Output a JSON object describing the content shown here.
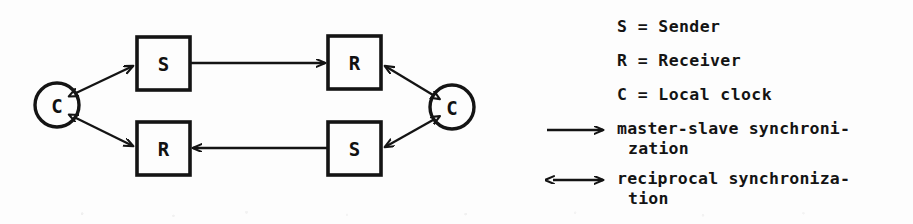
{
  "figure": {
    "kind": "synchronization-topology-diagram",
    "ink_color": "#141414",
    "paper_color": "#fdfdfd"
  },
  "diagram": {
    "nodes": [
      {
        "id": "clock-left",
        "shape": "circle",
        "label": "C",
        "cx": 57,
        "cy": 105,
        "r": 22
      },
      {
        "id": "sender-left",
        "shape": "box",
        "label": "S",
        "x": 137,
        "y": 37,
        "w": 53,
        "h": 53
      },
      {
        "id": "receiver-left",
        "shape": "box",
        "label": "R",
        "x": 137,
        "y": 122,
        "w": 53,
        "h": 53
      },
      {
        "id": "receiver-right",
        "shape": "box",
        "label": "R",
        "x": 328,
        "y": 36,
        "w": 53,
        "h": 53
      },
      {
        "id": "sender-right",
        "shape": "box",
        "label": "S",
        "x": 328,
        "y": 122,
        "w": 53,
        "h": 53
      },
      {
        "id": "clock-right",
        "shape": "circle",
        "label": "C",
        "cx": 452,
        "cy": 107,
        "r": 22
      }
    ],
    "edges": [
      {
        "id": "edge-sender-left-to-receiver-right",
        "from": "sender-left",
        "to": "receiver-right",
        "arrow": "single",
        "kind": "master-slave"
      },
      {
        "id": "edge-sender-right-to-receiver-left",
        "from": "sender-right",
        "to": "receiver-left",
        "arrow": "single",
        "kind": "master-slave"
      },
      {
        "id": "edge-clock-left-sender-left",
        "from": "clock-left",
        "to": "sender-left",
        "arrow": "double",
        "kind": "reciprocal"
      },
      {
        "id": "edge-clock-left-receiver-left",
        "from": "clock-left",
        "to": "receiver-left",
        "arrow": "double",
        "kind": "reciprocal"
      },
      {
        "id": "edge-clock-right-receiver-right",
        "from": "clock-right",
        "to": "receiver-right",
        "arrow": "double",
        "kind": "reciprocal"
      },
      {
        "id": "edge-clock-right-sender-right",
        "from": "clock-right",
        "to": "sender-right",
        "arrow": "double",
        "kind": "reciprocal"
      }
    ]
  },
  "legend": {
    "definitions": [
      "S = Sender",
      "R = Receiver",
      "C = Local clock"
    ],
    "entries": [
      {
        "symbol": "right-arrow",
        "line1": "master-slave synchroni-",
        "line2": "zation"
      },
      {
        "symbol": "bidirectional-arrow",
        "line1": "reciprocal synchroniza-",
        "line2": "tion"
      }
    ]
  }
}
